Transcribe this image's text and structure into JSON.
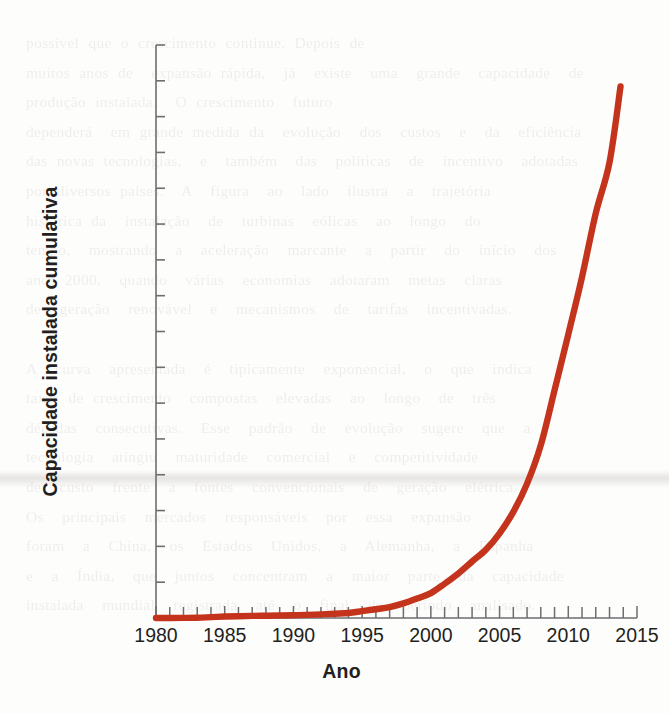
{
  "chart_data": {
    "type": "line",
    "title": "",
    "xlabel": "Ano",
    "ylabel": "Capacidade instalada cumulativa",
    "xlim": [
      1980,
      2015
    ],
    "ylim": [
      0,
      400000
    ],
    "grid": false,
    "legend": "none",
    "line_color": "#C4341C",
    "x_major_step": 5,
    "x_minor_step": 1,
    "y_major_step": 25000,
    "x_tick_labels": [
      "1980",
      "1985",
      "1990",
      "1995",
      "2000",
      "2005",
      "2010",
      "2015"
    ],
    "y_tick_labels": [
      "0",
      "25.000",
      "50.000",
      "75.000",
      "100.000",
      "125.000",
      "150.000",
      "175.000",
      "200.000",
      "225.000",
      "250.000",
      "275.000",
      "300.000",
      "325.000",
      "350.000",
      "375.000",
      "400.000"
    ],
    "y_tick_values": [
      0,
      25000,
      50000,
      75000,
      100000,
      125000,
      150000,
      175000,
      200000,
      225000,
      250000,
      275000,
      300000,
      325000,
      350000,
      375000,
      400000
    ],
    "x": [
      1980,
      1981,
      1982,
      1983,
      1984,
      1985,
      1986,
      1987,
      1988,
      1989,
      1990,
      1991,
      1992,
      1993,
      1994,
      1995,
      1996,
      1997,
      1998,
      1999,
      2000,
      2001,
      2002,
      2003,
      2004,
      2005,
      2006,
      2007,
      2008,
      2009,
      2010,
      2011,
      2012,
      2013,
      2013.8
    ],
    "series": [
      {
        "name": "Capacidade instalada cumulativa",
        "values": [
          10,
          25,
          90,
          210,
          600,
          1020,
          1270,
          1450,
          1580,
          1730,
          1930,
          2170,
          2510,
          2990,
          3490,
          4780,
          6100,
          7600,
          10200,
          13600,
          17400,
          23900,
          31100,
          39431,
          47620,
          59091,
          74052,
          93820,
          120690,
          158975,
          197956,
          238089,
          282587,
          318105,
          371000
        ]
      }
    ],
    "endpoint": {
      "x": 2013.8,
      "y": 371000
    },
    "bleed_text": "possível que o crescimento continue. Depois de\nmuitos anos de  expansão rápida,  já  existe  uma  grande  capacidade  de\nprodução instalada.  O crescimento  futuro\ndependerá  em grande medida da  evolução  dos  custos  e  da  eficiência\ndas novas tecnologias,  e  também  das  políticas  de  incentivo  adotadas\npor diversos países.  A  figura  ao  lado  ilustra  a  trajetória\nhistórica da  instalação  de  turbinas  eólicas  ao  longo  do\ntempo,  mostrando  a  aceleração  marcante  a  partir  do  início  dos\nanos 2000,  quando  várias  economias  adotaram  metas  claras\nde  geração  renovável  e  mecanismos  de  tarifas  incentivadas.\n\nA  curva  apresentada  é  tipicamente  exponencial,  o  que  indica\ntaxas de crescimento  compostas  elevadas  ao  longo  de  três\ndécadas  consecutivas.  Esse  padrão  de  evolução  sugere  que  a\ntecnologia  atingiu  maturidade  comercial  e  competitividade\nde  custo  frente  a  fontes  convencionais  de  geração  elétrica.\nOs  principais  mercados  responsáveis  por  essa  expansão\nforam  a  China,  os  Estados  Unidos,  a  Alemanha,  a  Espanha\ne  a  Índia,  que  juntos  concentram  a  maior  parte  da  capacidade\ninstalada  mundial  registrada  até  o  final  do  período  analisado."
  }
}
